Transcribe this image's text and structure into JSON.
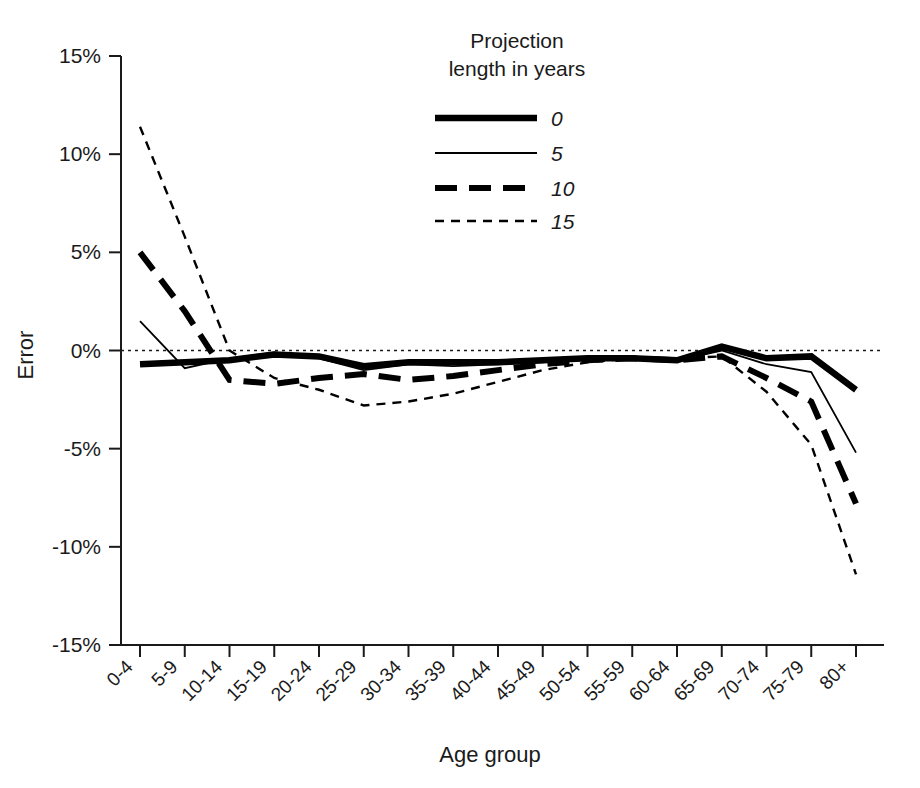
{
  "chart_data": {
    "type": "line",
    "title": "",
    "xlabel": "Age group",
    "ylabel": "Error",
    "categories": [
      "0-4",
      "5-9",
      "10-14",
      "15-19",
      "20-24",
      "25-29",
      "30-34",
      "35-39",
      "40-44",
      "45-49",
      "50-54",
      "55-59",
      "60-64",
      "65-69",
      "70-74",
      "75-79",
      "80+"
    ],
    "ylim": [
      -15,
      15
    ],
    "ytick_labels": [
      "15%",
      "10%",
      "5%",
      "0%",
      "-5%",
      "-10%",
      "-15%"
    ],
    "ytick_values": [
      15,
      10,
      5,
      0,
      -5,
      -10,
      -15
    ],
    "grid": false,
    "zero_reference_line": true,
    "legend_title_line1": "Projection",
    "legend_title_line2": "length in years",
    "legend_position": "top-center",
    "units": "percent",
    "series": [
      {
        "name": "0",
        "label": "0",
        "style": "solid-thick",
        "values": [
          -0.7,
          -0.6,
          -0.5,
          -0.2,
          -0.3,
          -0.8,
          -0.6,
          -0.6,
          -0.6,
          -0.5,
          -0.4,
          -0.4,
          -0.5,
          0.2,
          -0.4,
          -0.3,
          -2.0
        ]
      },
      {
        "name": "5",
        "label": "5",
        "style": "solid-thin",
        "values": [
          1.5,
          -0.9,
          -0.4,
          -0.1,
          -0.4,
          -1.0,
          -0.7,
          -0.8,
          -0.7,
          -0.6,
          -0.4,
          -0.4,
          -0.5,
          0.0,
          -0.7,
          -1.1,
          -5.2
        ]
      },
      {
        "name": "10",
        "label": "10",
        "style": "dashed-thick",
        "values": [
          5.0,
          2.0,
          -1.5,
          -1.7,
          -1.4,
          -1.2,
          -1.5,
          -1.3,
          -1.0,
          -0.7,
          -0.5,
          -0.4,
          -0.5,
          -0.3,
          -1.4,
          -2.6,
          -7.8
        ]
      },
      {
        "name": "15",
        "label": "15",
        "style": "dotted-thin",
        "values": [
          11.4,
          5.8,
          0.0,
          -1.4,
          -2.0,
          -2.8,
          -2.6,
          -2.2,
          -1.6,
          -1.0,
          -0.6,
          -0.4,
          -0.4,
          -0.3,
          -2.1,
          -4.8,
          -11.4
        ]
      }
    ]
  },
  "axes": {
    "y_axis_title": "Error",
    "x_axis_title": "Age group"
  },
  "legend": {
    "title_line1": "Projection",
    "title_line2": "length in years",
    "entries": [
      {
        "label": "0"
      },
      {
        "label": "5"
      },
      {
        "label": "10"
      },
      {
        "label": "15"
      }
    ]
  }
}
